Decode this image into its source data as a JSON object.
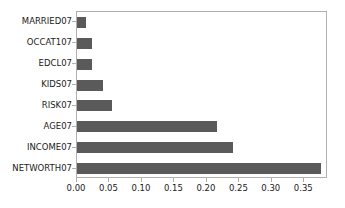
{
  "chart_data": {
    "type": "bar",
    "orientation": "horizontal",
    "title": "",
    "xlabel": "",
    "ylabel": "",
    "categories": [
      "MARRIED07",
      "OCCAT107",
      "EDCL07",
      "KIDS07",
      "RISK07",
      "AGE07",
      "INCOME07",
      "NETWORTH07"
    ],
    "values": [
      0.014,
      0.023,
      0.023,
      0.04,
      0.054,
      0.215,
      0.24,
      0.376
    ],
    "xlim": [
      0.0,
      0.3865
    ],
    "ylim": [
      -0.5,
      7.5
    ],
    "xticks": [
      0.0,
      0.05,
      0.1,
      0.15,
      0.2,
      0.25,
      0.3,
      0.35
    ],
    "xticklabels": [
      "0.00",
      "0.05",
      "0.10",
      "0.15",
      "0.20",
      "0.25",
      "0.30",
      "0.35"
    ],
    "grid": false,
    "legend": false,
    "bar_color": "#5a5a5a",
    "axes_color": "#b0b0b0",
    "text_color": "#1a1a1a"
  }
}
